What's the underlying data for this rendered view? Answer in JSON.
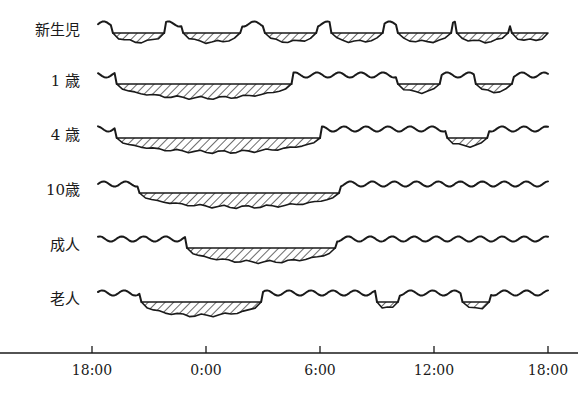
{
  "title": "",
  "axis": {
    "start_hour": 18,
    "span_hours": 24,
    "ticks": [
      {
        "offset_h": 0,
        "label": "18:00"
      },
      {
        "offset_h": 6,
        "label": "0:00"
      },
      {
        "offset_h": 12,
        "label": "6:00"
      },
      {
        "offset_h": 18,
        "label": "12:00"
      },
      {
        "offset_h": 24,
        "label": "18:00"
      }
    ]
  },
  "legend": {
    "sleep_pattern": "hatched",
    "wake_pattern": "wavy line"
  },
  "rows": [
    {
      "label": "新生児",
      "sleep": [
        [
          1.1,
          3.8
        ],
        [
          4.8,
          7.8
        ],
        [
          9.1,
          11.8
        ],
        [
          12.6,
          15.3
        ],
        [
          16.1,
          18.9
        ],
        [
          19.2,
          21.9
        ],
        [
          22.1,
          24.0
        ]
      ]
    },
    {
      "label": "1 歳",
      "sleep": [
        [
          1.3,
          10.5
        ],
        [
          16.1,
          18.3
        ],
        [
          20.2,
          22.1
        ]
      ]
    },
    {
      "label": "4 歳",
      "sleep": [
        [
          1.3,
          12.0
        ],
        [
          18.7,
          20.8
        ]
      ]
    },
    {
      "label": "10歳",
      "sleep": [
        [
          2.5,
          13.0
        ]
      ]
    },
    {
      "label": "成人",
      "sleep": [
        [
          5.0,
          12.8
        ]
      ]
    },
    {
      "label": "老人",
      "sleep": [
        [
          2.6,
          8.9
        ],
        [
          15.0,
          16.1
        ],
        [
          19.5,
          20.9
        ]
      ]
    }
  ]
}
